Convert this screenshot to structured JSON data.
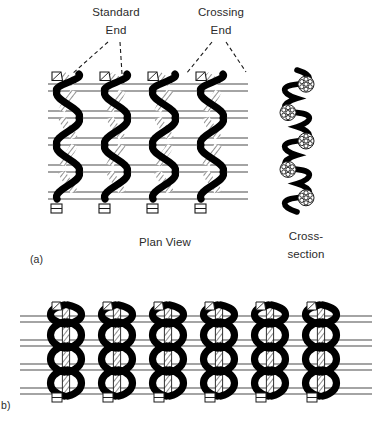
{
  "figure": {
    "type": "leno-weave-structure-diagram",
    "background_color": "#ffffff",
    "ink_color": "#000000",
    "weft_line_color": "#4a4a4a"
  },
  "annotations": {
    "standard_end_line1": "Standard",
    "standard_end_line2": "End",
    "crossing_end_line1": "Crossing",
    "crossing_end_line2": "End",
    "leader_style": "dashed"
  },
  "captions": {
    "plan_view": "Plan View",
    "cross_section_line1": "Cross-",
    "cross_section_line2": "section",
    "panel_a_label": "(a)",
    "panel_b_label": "b)"
  },
  "panel_a": {
    "name": "plan-view-open-leno",
    "columns": 4,
    "column_x": [
      68,
      116,
      164,
      212
    ],
    "column_pitch": 48,
    "weft_rows": 5,
    "weft_row_y": [
      84,
      111,
      138,
      165,
      192
    ],
    "weft_pair_gap": 7,
    "weft_left": 48,
    "weft_right": 248,
    "top_y": 74,
    "bottom_y": 212,
    "crossing_end_color": "#0d0d0d",
    "standard_end_color": "#ffffff",
    "standard_end_outline": "#1a1a1a"
  },
  "panel_a_cross_section": {
    "name": "cross-section-open-leno",
    "center_x": 297,
    "top_y": 70,
    "bottom_y": 212,
    "amplitude": 11,
    "cycles": 5,
    "yarn_bundles": 5,
    "bundle_radius": 8
  },
  "panel_b": {
    "name": "plan-view-dense-leno",
    "columns": 6,
    "column_x": [
      66,
      117,
      168,
      219,
      270,
      321
    ],
    "column_pitch": 51,
    "weft_rows": 4,
    "weft_row_y": [
      316,
      340,
      364,
      388
    ],
    "weft_pair_gap": 6,
    "weft_left": 20,
    "weft_right": 372,
    "top_y": 303,
    "bottom_y": 405
  }
}
